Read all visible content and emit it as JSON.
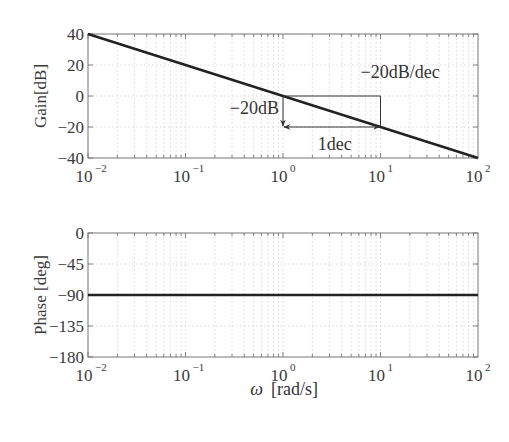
{
  "chart_data": [
    {
      "type": "line",
      "title": "",
      "xlabel": "",
      "ylabel": "Gain[dB]",
      "xscale": "log",
      "xlim": [
        0.01,
        100
      ],
      "ylim": [
        -40,
        40
      ],
      "x_ticks": [
        "10^-2",
        "10^-1",
        "10^0",
        "10^1",
        "10^2"
      ],
      "y_ticks": [
        "40",
        "20",
        "0",
        "-20",
        "-40"
      ],
      "grid": true,
      "series": [
        {
          "name": "gain",
          "x": [
            0.01,
            0.1,
            1,
            10,
            100
          ],
          "y": [
            40,
            20,
            0,
            -20,
            -40
          ]
        }
      ],
      "annotations": [
        {
          "text": "−20dB/dec",
          "x": 10,
          "y": 10
        },
        {
          "text": "−20dB",
          "x": 1,
          "y": -10,
          "type": "vertical-arrow",
          "from": [
            1,
            0
          ],
          "to": [
            1,
            -20
          ]
        },
        {
          "text": "1dec",
          "x": 3.16,
          "y": -27,
          "type": "double-arrow",
          "from": [
            1,
            -20
          ],
          "to": [
            10,
            -20
          ]
        },
        {
          "type": "box",
          "from": [
            1,
            0
          ],
          "to": [
            10,
            -20
          ]
        }
      ]
    },
    {
      "type": "line",
      "title": "",
      "xlabel": "ω  [rad/s]",
      "ylabel": "Phase [deg]",
      "xscale": "log",
      "xlim": [
        0.01,
        100
      ],
      "ylim": [
        -180,
        0
      ],
      "x_ticks": [
        "10^-2",
        "10^-1",
        "10^0",
        "10^1",
        "10^2"
      ],
      "y_ticks": [
        "0",
        "-45",
        "-90",
        "-135",
        "-180"
      ],
      "grid": true,
      "series": [
        {
          "name": "phase",
          "x": [
            0.01,
            100
          ],
          "y": [
            -90,
            -90
          ]
        }
      ]
    }
  ],
  "labels": {
    "gain_ylabel": "Gain[dB]",
    "phase_ylabel": "Phase [deg]",
    "xlabel_omega": "ω",
    "xlabel_unit": "[rad/s]",
    "slope": "−20dB/dec",
    "drop": "−20dB",
    "decade": "1dec",
    "gain_ticks": [
      "40",
      "20",
      "0",
      "−20",
      "−40"
    ],
    "phase_ticks": [
      "0",
      "−45",
      "−90",
      "−135",
      "−180"
    ],
    "x_base": "10",
    "x_exps": [
      "−2",
      "−1",
      "0",
      "1",
      "2"
    ]
  }
}
